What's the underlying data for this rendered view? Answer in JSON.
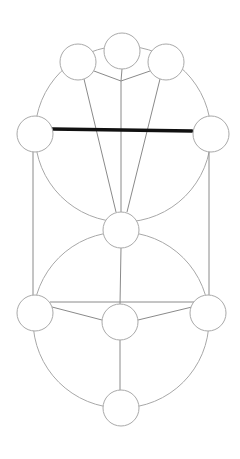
{
  "diagram": {
    "title": "",
    "colors": {
      "background": "#ffffff",
      "node_stroke": "#a9a9a9",
      "edge": "#8a8a8a",
      "highlight_edge": "#111111"
    },
    "node_radius": 18,
    "nodes": [
      {
        "id": "top",
        "x": 122,
        "y": 51
      },
      {
        "id": "top-left",
        "x": 78,
        "y": 62
      },
      {
        "id": "top-right",
        "x": 167,
        "y": 62
      },
      {
        "id": "mid-left",
        "x": 35,
        "y": 133
      },
      {
        "id": "mid-right",
        "x": 211,
        "y": 134
      },
      {
        "id": "center",
        "x": 121,
        "y": 230
      },
      {
        "id": "low-left",
        "x": 35,
        "y": 313
      },
      {
        "id": "low-center",
        "x": 120,
        "y": 322
      },
      {
        "id": "low-right",
        "x": 208,
        "y": 313
      },
      {
        "id": "bottom",
        "x": 121,
        "y": 408
      }
    ],
    "edges": [
      {
        "from": "top",
        "to": "junction",
        "type": "line"
      },
      {
        "from": "top-left",
        "to": "junction",
        "type": "line"
      },
      {
        "from": "top-right",
        "to": "junction",
        "type": "line"
      },
      {
        "from": "junction",
        "to": "center",
        "type": "line"
      },
      {
        "from": "top-left",
        "to": "center",
        "type": "line"
      },
      {
        "from": "top-right",
        "to": "center",
        "type": "line"
      },
      {
        "from": "mid-left",
        "to": "mid-right",
        "type": "line",
        "highlight": true
      },
      {
        "from": "mid-left",
        "to": "low-left",
        "type": "line"
      },
      {
        "from": "mid-right",
        "to": "low-right",
        "type": "line"
      },
      {
        "from": "center",
        "to": "low-center",
        "type": "line"
      },
      {
        "from": "low-left",
        "to": "low-right",
        "type": "line"
      },
      {
        "from": "low-left",
        "to": "low-center",
        "type": "line"
      },
      {
        "from": "low-right",
        "to": "low-center",
        "type": "line"
      },
      {
        "from": "low-center",
        "to": "bottom",
        "type": "line"
      }
    ],
    "circles": [
      {
        "id": "upper-circle",
        "cx": 123,
        "cy": 134,
        "r": 88
      },
      {
        "id": "lower-circle",
        "cx": 121,
        "cy": 320,
        "r": 88
      }
    ],
    "junction": {
      "x": 121,
      "y": 81
    }
  }
}
